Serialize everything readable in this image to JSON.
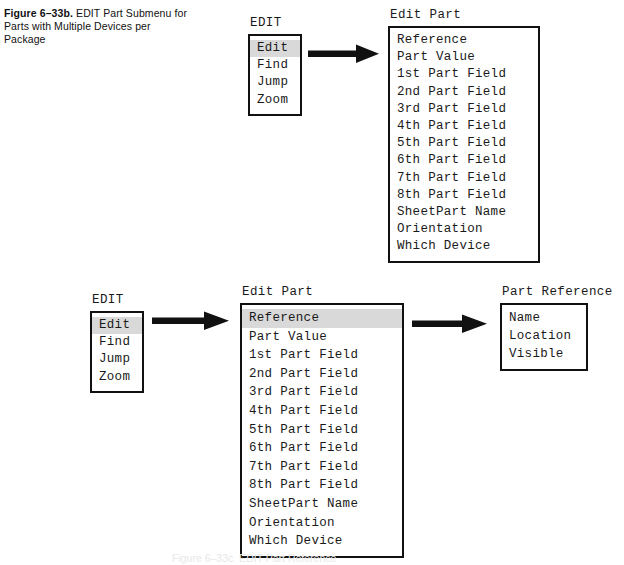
{
  "figure": {
    "label": "Figure 6–33b.",
    "caption": "EDIT Part Submenu for Parts with Multiple Devices per Package",
    "bottom_caption_partial": "Figure 6–33c.  EDIT Part Reference"
  },
  "colors": {
    "ink": "#111111",
    "highlight": "#d9d9d9",
    "page_background": "#ffffff"
  },
  "top_row": {
    "edit_menu": {
      "title": "EDIT",
      "items": [
        {
          "label": "Edit",
          "selected": true
        },
        {
          "label": "Find",
          "selected": false
        },
        {
          "label": "Jump",
          "selected": false
        },
        {
          "label": "Zoom",
          "selected": false
        }
      ]
    },
    "edit_part_menu": {
      "title": "Edit Part",
      "items": [
        {
          "label": "Reference",
          "selected": false
        },
        {
          "label": "Part Value",
          "selected": false
        },
        {
          "label": "1st Part Field",
          "selected": false
        },
        {
          "label": "2nd Part Field",
          "selected": false
        },
        {
          "label": "3rd Part Field",
          "selected": false
        },
        {
          "label": "4th Part Field",
          "selected": false
        },
        {
          "label": "5th Part Field",
          "selected": false
        },
        {
          "label": "6th Part Field",
          "selected": false
        },
        {
          "label": "7th Part Field",
          "selected": false
        },
        {
          "label": "8th Part Field",
          "selected": false
        },
        {
          "label": "SheetPart Name",
          "selected": false
        },
        {
          "label": "Orientation",
          "selected": false
        },
        {
          "label": "Which Device",
          "selected": false
        }
      ]
    },
    "arrow": {
      "name": "arrow-right",
      "from": "edit-menu",
      "to": "edit-part-menu"
    }
  },
  "bottom_row": {
    "edit_menu": {
      "title": "EDIT",
      "items": [
        {
          "label": "Edit",
          "selected": true
        },
        {
          "label": "Find",
          "selected": false
        },
        {
          "label": "Jump",
          "selected": false
        },
        {
          "label": "Zoom",
          "selected": false
        }
      ]
    },
    "edit_part_menu": {
      "title": "Edit Part",
      "items": [
        {
          "label": "Reference",
          "selected": true
        },
        {
          "label": "Part Value",
          "selected": false
        },
        {
          "label": "1st Part Field",
          "selected": false
        },
        {
          "label": "2nd Part Field",
          "selected": false
        },
        {
          "label": "3rd Part Field",
          "selected": false
        },
        {
          "label": "4th Part Field",
          "selected": false
        },
        {
          "label": "5th Part Field",
          "selected": false
        },
        {
          "label": "6th Part Field",
          "selected": false
        },
        {
          "label": "7th Part Field",
          "selected": false
        },
        {
          "label": "8th Part Field",
          "selected": false
        },
        {
          "label": "SheetPart Name",
          "selected": false
        },
        {
          "label": "Orientation",
          "selected": false
        },
        {
          "label": "Which Device",
          "selected": false
        }
      ]
    },
    "part_reference_menu": {
      "title": "Part Reference",
      "items": [
        {
          "label": "Name",
          "selected": false
        },
        {
          "label": "Location",
          "selected": false
        },
        {
          "label": "Visible",
          "selected": false
        }
      ]
    },
    "arrow_left": {
      "name": "arrow-right",
      "from": "edit-menu",
      "to": "edit-part-menu"
    },
    "arrow_right": {
      "name": "arrow-right",
      "from": "edit-part-menu",
      "to": "part-reference-menu"
    }
  }
}
